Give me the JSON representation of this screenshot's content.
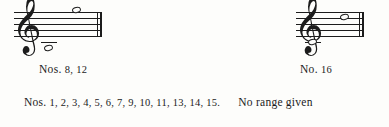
{
  "figure": {
    "type": "music-range-notation",
    "systems": [
      {
        "id": "left",
        "clef": "treble-clef",
        "clef_glyph": "𝄞",
        "notes": [
          {
            "name": "low-range-note",
            "pitch": "C4",
            "position": "ledger-line-below-staff",
            "duration": "whole"
          },
          {
            "name": "high-range-note",
            "pitch": "G5",
            "position": "above-top-staff-line",
            "duration": "whole"
          }
        ],
        "barline": "final-double-barline",
        "caption_prefix": "Nos.",
        "caption_numbers": "8, 12"
      },
      {
        "id": "right",
        "clef": "treble-clef",
        "clef_glyph": "𝄞",
        "notes": [
          {
            "name": "low-range-note",
            "pitch": "C4",
            "position": "ledger-line-below-staff",
            "duration": "whole"
          },
          {
            "name": "high-range-note",
            "pitch": "F5",
            "position": "top-staff-line",
            "duration": "whole"
          }
        ],
        "barline": "final-double-barline",
        "caption_prefix": "No.",
        "caption_numbers": "16"
      }
    ]
  },
  "footer": {
    "left_prefix": "Nos.",
    "left_numbers": "1, 2, 3, 4, 5, 6, 7, 9, 10, 11, 13, 14, 15.",
    "right_text": "No range given"
  },
  "colors": {
    "ink": "#1c1c1c",
    "paper": "#fdfdfb"
  }
}
